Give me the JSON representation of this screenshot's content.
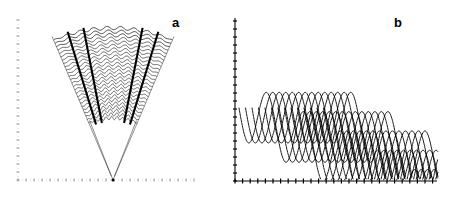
{
  "figure": {
    "background_color": "#ffffff",
    "ink_color": "#000000",
    "width": 454,
    "height": 199,
    "panel_count": 2
  },
  "panels": [
    {
      "id": "a",
      "label": "a",
      "label_position": "top-right",
      "description": "Fan-shaped bundle of nested wavy arcs radiating from a single apex point located on the bottom axis",
      "axes": {
        "style": "dotted",
        "x_axis": {
          "style": "dotted",
          "tick_count": 23,
          "tick_spacing_px": 8,
          "y_px": 180,
          "x_start_px": 18,
          "x_end_px": 194
        },
        "y_axis": {
          "style": "dotted",
          "tick_count": 21,
          "tick_spacing_px": 8,
          "x_px": 18,
          "y_start_px": 20,
          "y_end_px": 180
        }
      },
      "geometry": {
        "apex_x_px": 113,
        "apex_y_px": 180,
        "half_angle_deg": 23,
        "arc_count": 26,
        "inner_radius_px": 62,
        "outer_radius_px": 152,
        "wave_cycles_per_arc": 9,
        "wave_amplitude_px": 1.7,
        "bold_ray_angles_deg": [
          -17,
          -11,
          11,
          17
        ],
        "thin_ray_angles_deg": [
          -23,
          23
        ]
      }
    },
    {
      "id": "b",
      "label": "b",
      "label_position": "top-right",
      "description": "Oblique bundle of overlapping sinusoidal trajectories forming a lattice, descending left to right onto the horizontal axis",
      "axes": {
        "style": "solid",
        "x_axis": {
          "style": "solid",
          "tick_count": 27,
          "tick_spacing_px": 7.6,
          "y_px": 181,
          "x_start_px": 8,
          "x_end_px": 210
        },
        "y_axis": {
          "style": "solid",
          "tick_count": 21,
          "tick_spacing_px": 8,
          "x_px": 8,
          "y_start_px": 18,
          "y_end_px": 181
        }
      },
      "geometry": {
        "wave_count": 14,
        "wave_cycles": 5.2,
        "wave_amplitude_px": 30,
        "bundle_slope": -0.52,
        "bundle_x_start_px": 12,
        "bundle_x_end_px": 205,
        "bundle_y_top_px": 108,
        "bundle_offset_step_px": 6.5
      }
    }
  ],
  "chart_data": {
    "type": "line",
    "title": "",
    "subtitle": "",
    "xlabel": "",
    "ylabel": "",
    "grid": false,
    "legend": null,
    "annotations": [
      "a",
      "b"
    ],
    "panels": [
      {
        "name": "a",
        "type": "line",
        "plot_kind": "polar-fan of nested wavy arcs",
        "series_count": 26,
        "theta_range_deg": [
          -23,
          23
        ],
        "radius_range_px": [
          62,
          152
        ],
        "apex": [
          113,
          180
        ],
        "ray_count": 6
      },
      {
        "name": "b",
        "type": "line",
        "plot_kind": "overlapping sinusoidal trajectory bundle",
        "series_count": 14,
        "cycles": 5.2,
        "amplitude": 30,
        "xlim": [
          8,
          210
        ],
        "ylim": [
          18,
          181
        ]
      }
    ]
  }
}
